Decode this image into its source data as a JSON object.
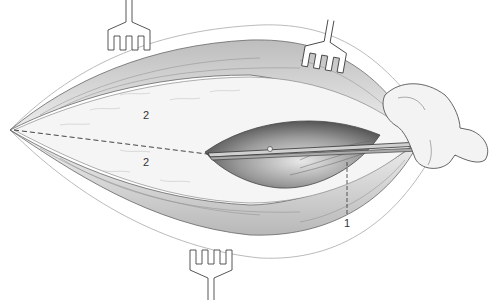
{
  "figure": {
    "labels": [
      {
        "id": "label-2-upper",
        "text": "2",
        "x": 143,
        "y": 110
      },
      {
        "id": "label-2-lower",
        "text": "2",
        "x": 143,
        "y": 157
      },
      {
        "id": "label-1",
        "text": "1",
        "x": 344,
        "y": 218
      }
    ],
    "icons": [
      "retractor-icon",
      "retractor-icon",
      "retractor-icon",
      "scissors-icon",
      "hand-icon"
    ],
    "colors": {
      "line": "#555555",
      "tissue": "#d8d8d8",
      "shadow": "#8a8a8a",
      "background": "#ffffff"
    }
  }
}
